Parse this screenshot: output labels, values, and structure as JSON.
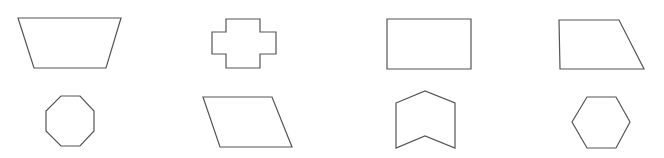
{
  "diagram": {
    "background": "#ffffff",
    "stroke_color": "#555555",
    "layout": "2 rows x 4 columns grid of outlined polygons",
    "shapes": [
      {
        "row": 1,
        "col": 1,
        "name": "trapezoid",
        "points": "18,18 121,18 106,68 34,68"
      },
      {
        "row": 1,
        "col": 2,
        "name": "cross",
        "points": "226,19 260,19 260,32 276,32 276,54 260,54 260,68 226,68 226,54 212,54 212,32 226,32"
      },
      {
        "row": 1,
        "col": 3,
        "name": "rectangle",
        "points": "387,19 471,19 471,69 387,69"
      },
      {
        "row": 1,
        "col": 4,
        "name": "right-trapezoid",
        "points": "559,20 619,20 644,69 560,69"
      },
      {
        "row": 2,
        "col": 1,
        "name": "octagon",
        "points": "61,96 80,96 94,111 94,131 80,146 61,146 46,131 46,111"
      },
      {
        "row": 2,
        "col": 2,
        "name": "parallelogram",
        "points": "203,97 272,97 292,147 220,147"
      },
      {
        "row": 2,
        "col": 3,
        "name": "chevron-pentagon",
        "points": "396,103 425,91 455,103 455,148 425,136 396,148"
      },
      {
        "row": 2,
        "col": 4,
        "name": "hexagon",
        "points": "587,97 616,97 630,122 616,148 587,148 572,122"
      }
    ]
  }
}
